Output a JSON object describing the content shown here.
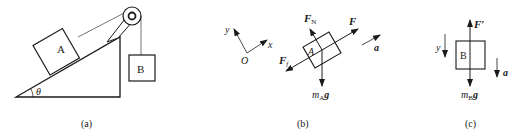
{
  "figures": [
    {
      "id": "a",
      "caption": "(a)",
      "block_a_label": "A",
      "block_b_label": "B",
      "angle_label": "θ"
    },
    {
      "id": "b",
      "caption": "(b)",
      "axis_y": "y",
      "axis_x": "x",
      "origin": "O",
      "block_label": "A",
      "force_normal": "F",
      "force_normal_sub": "N",
      "force_applied": "F",
      "force_friction": "F",
      "force_friction_sub": "f",
      "weight_m": "m",
      "weight_sub": "A",
      "weight_g": "g",
      "accel": "a"
    },
    {
      "id": "c",
      "caption": "(c)",
      "axis_y": "y",
      "block_label": "B",
      "force_tension": "F′",
      "weight_m": "m",
      "weight_sub": "B",
      "weight_g": "g",
      "accel": "a"
    }
  ],
  "colors": {
    "ink": "#1a1a1a",
    "background": "#ffffff"
  }
}
